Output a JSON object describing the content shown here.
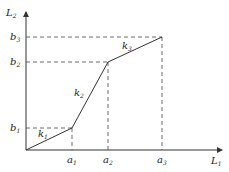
{
  "diagram": {
    "type": "piecewise-linear-function",
    "axes": {
      "x_label": {
        "base": "L",
        "sub": "1"
      },
      "y_label": {
        "base": "L",
        "sub": "2"
      }
    },
    "x_ticks": [
      {
        "base": "a",
        "sub": "1"
      },
      {
        "base": "a",
        "sub": "2"
      },
      {
        "base": "a",
        "sub": "3"
      }
    ],
    "y_ticks": [
      {
        "base": "b",
        "sub": "1"
      },
      {
        "base": "b",
        "sub": "2"
      },
      {
        "base": "b",
        "sub": "3"
      }
    ],
    "segments": [
      {
        "label": {
          "base": "k",
          "sub": "1"
        },
        "from": "O",
        "to": "(a1, b1)"
      },
      {
        "label": {
          "base": "k",
          "sub": "2"
        },
        "from": "(a1, b1)",
        "to": "(a2, b2)"
      },
      {
        "label": {
          "base": "k",
          "sub": "3"
        },
        "from": "(a2, b2)",
        "to": "(a3, b3)"
      }
    ]
  }
}
